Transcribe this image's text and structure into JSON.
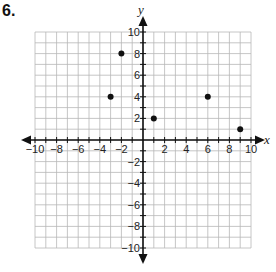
{
  "problem": {
    "number": "6."
  },
  "chart_data": {
    "type": "scatter",
    "title": "",
    "xlabel": "x",
    "ylabel": "y",
    "xlim": [
      -10,
      10
    ],
    "ylim": [
      -10,
      10
    ],
    "grid": true,
    "grid_step": 1,
    "x_tick_labels": [
      "−10",
      "−8",
      "−6",
      "−4",
      "−2",
      "2",
      "4",
      "6",
      "8",
      "10"
    ],
    "y_tick_labels": [
      "10",
      "8",
      "6",
      "4",
      "2",
      "−2",
      "−4",
      "−6",
      "−8",
      "−10"
    ],
    "points": [
      {
        "x": -3,
        "y": 4
      },
      {
        "x": -2,
        "y": 8
      },
      {
        "x": 1,
        "y": 2
      },
      {
        "x": 6,
        "y": 4
      },
      {
        "x": 9,
        "y": 1
      }
    ],
    "colors": {
      "grid": "#b8b8b8",
      "axis": "#111111",
      "point": "#111111"
    }
  }
}
